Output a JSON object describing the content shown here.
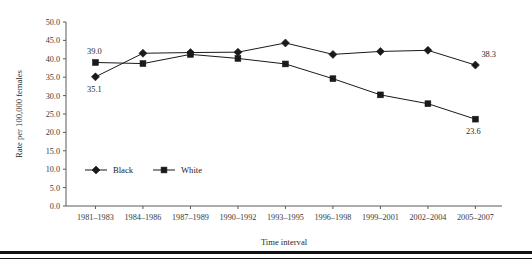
{
  "chart_data": {
    "type": "line",
    "title": "",
    "xlabel": "Time interval",
    "ylabel": "Rate per 100,000 females",
    "categories": [
      "1981–1983",
      "1984–1986",
      "1987–1989",
      "1990–1992",
      "1993–1995",
      "1996–1998",
      "1999–2001",
      "2002–2004",
      "2005–2007"
    ],
    "ylim": [
      0,
      50
    ],
    "ytick_labels": [
      "0.0",
      "5.0",
      "10.0",
      "15.0",
      "20.0",
      "25.0",
      "30.0",
      "35.0",
      "40.0",
      "45.0",
      "50.0"
    ],
    "ytick_values": [
      0,
      5,
      10,
      15,
      20,
      25,
      30,
      35,
      40,
      45,
      50
    ],
    "grid": false,
    "legend_position": "inside-lower-left",
    "series": [
      {
        "name": "Black",
        "marker": "diamond",
        "color": "#1a1a1a",
        "values": [
          35.1,
          41.5,
          41.7,
          41.8,
          44.3,
          41.2,
          42.0,
          42.3,
          38.3
        ]
      },
      {
        "name": "White",
        "marker": "square",
        "color": "#1a1a1a",
        "values": [
          39.0,
          38.7,
          41.2,
          40.1,
          38.6,
          34.6,
          30.2,
          27.8,
          23.6
        ]
      }
    ],
    "annotations": [
      {
        "text": "39.0",
        "series": "White",
        "index": 0,
        "placement": "above-left"
      },
      {
        "text": "35.1",
        "series": "Black",
        "index": 0,
        "placement": "below-left"
      },
      {
        "text": "38.3",
        "series": "Black",
        "index": 8,
        "placement": "above-right"
      },
      {
        "text": "23.6",
        "series": "White",
        "index": 8,
        "placement": "below-right"
      }
    ]
  },
  "legend": {
    "entries": [
      {
        "label": "Black",
        "marker": "diamond"
      },
      {
        "label": "White",
        "marker": "square"
      }
    ]
  }
}
